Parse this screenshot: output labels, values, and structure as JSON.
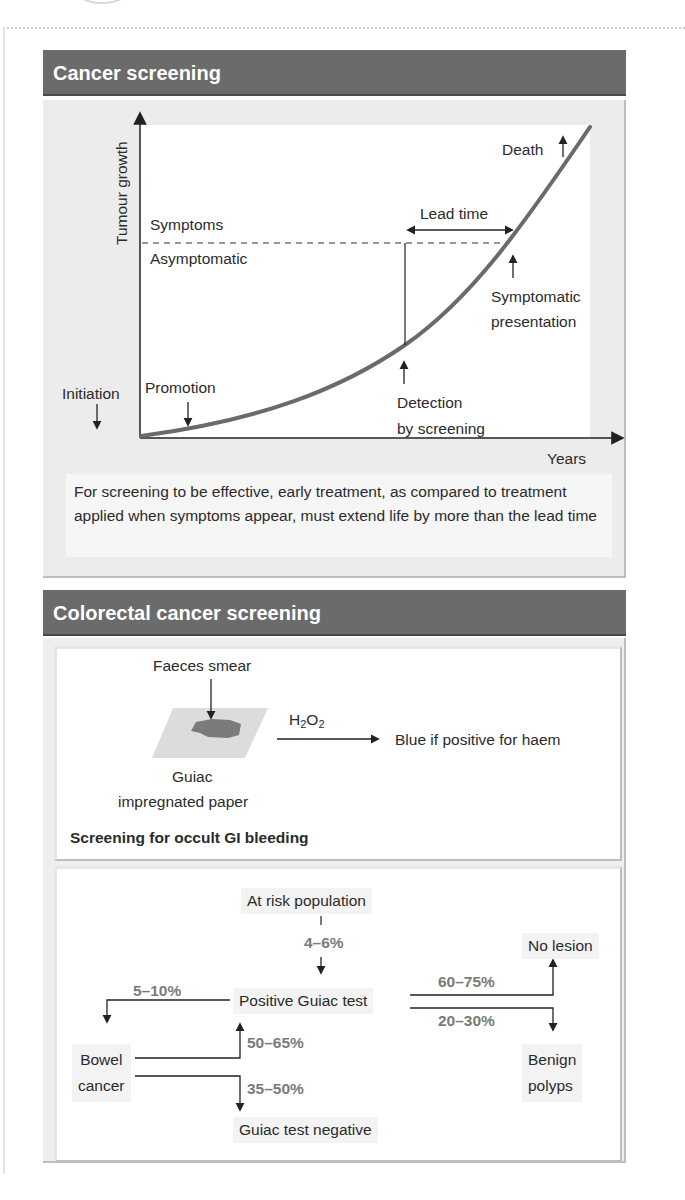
{
  "cancer_screening": {
    "title": "Cancer screening",
    "y_axis_label": "Tumour growth",
    "x_axis_label": "Years",
    "threshold_above": "Symptoms",
    "threshold_below": "Asymptomatic",
    "lead_time_label": "Lead time",
    "events": {
      "initiation": "Initiation",
      "promotion": "Promotion",
      "detection_line1": "Detection",
      "detection_line2": "by screening",
      "symptomatic_line1": "Symptomatic",
      "symptomatic_line2": "presentation",
      "death": "Death"
    },
    "footnote": "For screening to be effective, early treatment, as compared to treatment applied when symptoms appear, must extend life by more than the lead time",
    "colors": {
      "header": "#6b6b6b",
      "curve": "#6a6a6a",
      "panel_bg": "#ececec"
    }
  },
  "colorectal": {
    "title": "Colorectal cancer screening",
    "guiac": {
      "faeces_label": "Faeces smear",
      "reagent": "H2O2",
      "reagent_main": "H",
      "reagent_sub1": "2",
      "reagent_mid": "O",
      "reagent_sub2": "2",
      "result": "Blue if positive for haem",
      "paper_line1": "Guiac",
      "paper_line2": "impregnated paper",
      "caption": "Screening for occult GI bleeding"
    },
    "flow": {
      "at_risk": "At risk population",
      "to_positive_pct": "4–6%",
      "positive": "Positive Guiac test",
      "no_lesion_pct": "60–75%",
      "no_lesion": "No lesion",
      "benign_pct": "20–30%",
      "benign_line1": "Benign",
      "benign_line2": "polyps",
      "bowel_pct": "5–10%",
      "bowel_line1": "Bowel",
      "bowel_line2": "cancer",
      "bowel_positive_pct": "50–65%",
      "bowel_negative_pct": "35–50%",
      "negative": "Guiac test negative"
    }
  }
}
